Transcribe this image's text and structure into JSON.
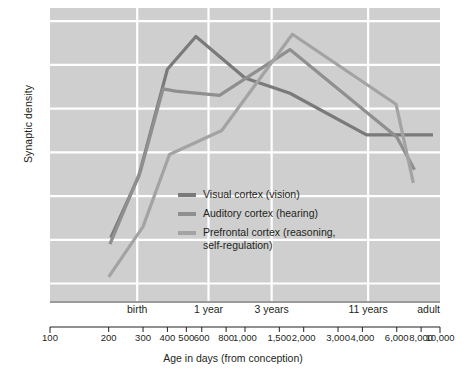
{
  "chart_data": {
    "type": "line",
    "title": "",
    "xlabel": "Age in days (from conception)",
    "ylabel": "Synaptic density",
    "xscale": "log",
    "xlim": [
      100,
      10000
    ],
    "ylim": [
      -4,
      63
    ],
    "grid": true,
    "legend_position": "inside-center-left",
    "y_ticks": [
      0,
      10,
      20,
      30,
      40,
      50,
      60
    ],
    "x_category_ticks": [
      {
        "label": "birth",
        "days": 280
      },
      {
        "label": "1 year",
        "days": 650
      },
      {
        "label": "3 years",
        "days": 1370
      },
      {
        "label": "11 years",
        "days": 4280
      },
      {
        "label": "adult",
        "days": 9500
      }
    ],
    "x_log_ticks": [
      {
        "label": "100",
        "value": 100
      },
      {
        "label": "200",
        "value": 200
      },
      {
        "label": "300",
        "value": 300
      },
      {
        "label": "400",
        "value": 400
      },
      {
        "label": "500",
        "value": 500
      },
      {
        "label": "600",
        "value": 600
      },
      {
        "label": "800",
        "value": 800
      },
      {
        "label": "1,000",
        "value": 1000
      },
      {
        "label": "1,500",
        "value": 1500
      },
      {
        "label": "2,000",
        "value": 2000
      },
      {
        "label": "3,000",
        "value": 3000
      },
      {
        "label": "4,000",
        "value": 4000
      },
      {
        "label": "6,000",
        "value": 6000
      },
      {
        "label": "8,000",
        "value": 8000
      },
      {
        "label": "10,000",
        "value": 10000
      }
    ],
    "series": [
      {
        "name": "Visual cortex (vision)",
        "legend_label": "Visual cortex (vision)",
        "color": "#7a7a7a",
        "points": [
          {
            "x": 205,
            "y": 10.5
          },
          {
            "x": 285,
            "y": 24.5
          },
          {
            "x": 400,
            "y": 49.0
          },
          {
            "x": 560,
            "y": 56.5
          },
          {
            "x": 1000,
            "y": 47.0
          },
          {
            "x": 1700,
            "y": 43.5
          },
          {
            "x": 4200,
            "y": 34.0
          },
          {
            "x": 6100,
            "y": 34.0
          },
          {
            "x": 9200,
            "y": 34.0
          }
        ]
      },
      {
        "name": "Auditory cortex (hearing)",
        "legend_label": "Auditory cortex (hearing)",
        "color": "#8f8f8f",
        "points": [
          {
            "x": 203,
            "y": 9.0
          },
          {
            "x": 290,
            "y": 25.5
          },
          {
            "x": 380,
            "y": 44.5
          },
          {
            "x": 440,
            "y": 44.0
          },
          {
            "x": 740,
            "y": 43.0
          },
          {
            "x": 1700,
            "y": 53.5
          },
          {
            "x": 6000,
            "y": 33.5
          },
          {
            "x": 7400,
            "y": 26.0
          }
        ]
      },
      {
        "name": "Prefrontal cortex (reasoning, self-regulation)",
        "legend_label": "Prefrontal cortex (reasoning,\nself-regulation)",
        "color": "#a3a3a3",
        "points": [
          {
            "x": 200,
            "y": 1.5
          },
          {
            "x": 300,
            "y": 13.0
          },
          {
            "x": 410,
            "y": 29.5
          },
          {
            "x": 760,
            "y": 35.0
          },
          {
            "x": 1750,
            "y": 57.0
          },
          {
            "x": 5950,
            "y": 41.0
          },
          {
            "x": 7300,
            "y": 23.0
          }
        ]
      }
    ]
  },
  "axes": {
    "y_title": "Synaptic density",
    "x_title": "Age in days (from conception)"
  },
  "colors": {
    "plot_background": "#cfcfcf",
    "gridline": "#ffffff",
    "axis_line": "#9a9a9a",
    "text": "#231f20",
    "series_visual": "#7a7a7a",
    "series_auditory": "#8f8f8f",
    "series_prefrontal": "#a3a3a3"
  }
}
